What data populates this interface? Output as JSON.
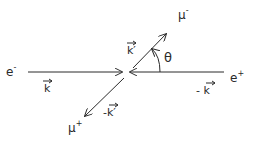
{
  "diagram": {
    "type": "scattering-kinematics",
    "particles": {
      "electron": {
        "label": "e",
        "charge": "-",
        "momentum": "k",
        "momentum_sign": ""
      },
      "positron": {
        "label": "e",
        "charge": "+",
        "momentum": "k",
        "momentum_sign": "- "
      },
      "muon_minus": {
        "label": "μ",
        "charge": "-",
        "momentum": "k′",
        "momentum_sign": ""
      },
      "muon_plus": {
        "label": "μ",
        "charge": "+",
        "momentum": "k′",
        "momentum_sign": "-"
      }
    },
    "angle": {
      "label": "θ"
    },
    "colors": {
      "ink": "#2a2a2a",
      "background": "#ffffff"
    }
  }
}
